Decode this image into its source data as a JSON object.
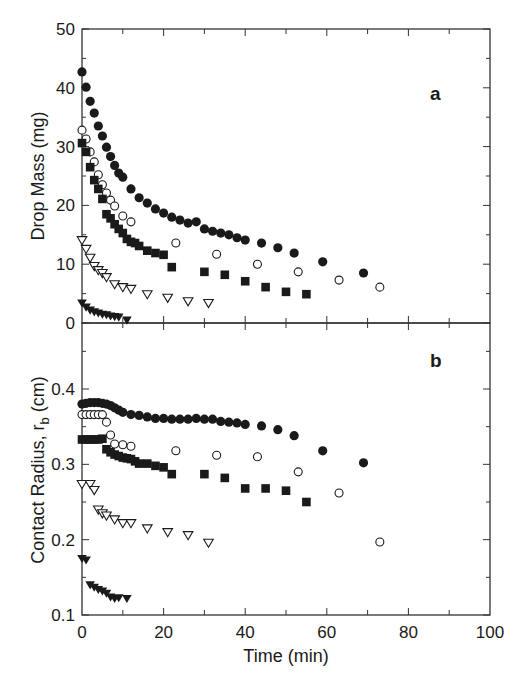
{
  "chart_data": [
    {
      "panel": "a",
      "type": "scatter",
      "title": "",
      "panel_label": "a",
      "xlabel": "Time (min)",
      "ylabel": "Drop Mass (mg)",
      "xlim": [
        0,
        100
      ],
      "ylim": [
        0,
        50
      ],
      "yticks": [
        0,
        10,
        20,
        30,
        40,
        50
      ],
      "grid": false,
      "series": [
        {
          "name": "filled circles",
          "marker": "filled-circle",
          "x": [
            0,
            1,
            2,
            3,
            4,
            5,
            6,
            7,
            8,
            9,
            10,
            12,
            14,
            16,
            18,
            20,
            22,
            24,
            26,
            28,
            30,
            32,
            34,
            36,
            38,
            40,
            44,
            48,
            52,
            59,
            69
          ],
          "y": [
            42.7,
            40.1,
            37.7,
            35.7,
            33.5,
            31.8,
            29.9,
            28.3,
            26.8,
            25.5,
            24.8,
            22.8,
            21.3,
            20.4,
            19.4,
            18.7,
            18.0,
            17.5,
            17.0,
            17.2,
            16.0,
            15.6,
            15.3,
            15.0,
            14.5,
            14.1,
            13.6,
            12.8,
            11.9,
            10.4,
            8.5
          ]
        },
        {
          "name": "open circles",
          "marker": "open-circle",
          "x": [
            0,
            1,
            2,
            3,
            4,
            5,
            6,
            7,
            8,
            10,
            12,
            23,
            33,
            43,
            53,
            63,
            73
          ],
          "y": [
            32.8,
            31.3,
            29.1,
            27.4,
            25.2,
            23.5,
            22.1,
            20.9,
            19.9,
            18.2,
            17.2,
            13.6,
            11.7,
            10.0,
            8.7,
            7.3,
            6.1
          ]
        },
        {
          "name": "filled squares",
          "marker": "filled-square",
          "x": [
            0,
            1,
            2,
            3,
            4,
            5,
            6,
            7,
            8,
            9,
            10,
            11,
            12,
            13,
            14,
            16,
            18,
            20,
            22,
            30,
            35,
            40,
            45,
            50,
            55
          ],
          "y": [
            30.6,
            29.1,
            26.5,
            24.3,
            22.8,
            21.1,
            18.5,
            17.8,
            16.8,
            16.0,
            15.3,
            14.3,
            13.8,
            13.6,
            13.1,
            12.3,
            11.9,
            11.6,
            9.5,
            8.7,
            8.2,
            7.1,
            6.1,
            5.3,
            4.9
          ]
        },
        {
          "name": "open triangles",
          "marker": "open-triangle-down",
          "x": [
            0,
            1,
            2,
            3,
            4,
            5,
            6,
            8,
            10,
            12,
            16,
            21,
            26,
            31
          ],
          "y": [
            14.1,
            12.6,
            11.1,
            9.7,
            9.0,
            8.5,
            7.8,
            6.6,
            6.1,
            5.8,
            4.9,
            4.3,
            3.7,
            3.4
          ]
        },
        {
          "name": "filled triangles",
          "marker": "filled-triangle-down",
          "x": [
            0,
            1,
            2,
            3,
            4,
            5,
            6,
            7,
            8,
            9,
            11
          ],
          "y": [
            3.4,
            2.7,
            2.2,
            1.9,
            1.7,
            1.5,
            1.4,
            1.2,
            1.1,
            1.0,
            0.5
          ]
        }
      ]
    },
    {
      "panel": "b",
      "type": "scatter",
      "title": "",
      "panel_label": "b",
      "xlabel": "Time (min)",
      "ylabel": "Contact Radius, r_b (cm)",
      "ylabel_main": "Contact Radius, r",
      "ylabel_sub": "b",
      "ylabel_unit": " (cm)",
      "xlim": [
        0,
        100
      ],
      "ylim": [
        0.1,
        0.487
      ],
      "yticks": [
        0.1,
        0.2,
        0.3,
        0.4
      ],
      "xticks": [
        0,
        20,
        40,
        60,
        80,
        100
      ],
      "grid": false,
      "series": [
        {
          "name": "filled circles",
          "marker": "filled-circle",
          "x": [
            0,
            1,
            2,
            3,
            4,
            5,
            6,
            7,
            8,
            9,
            10,
            12,
            14,
            16,
            18,
            20,
            22,
            24,
            26,
            28,
            30,
            32,
            34,
            36,
            38,
            40,
            44,
            48,
            52,
            59,
            69
          ],
          "y": [
            0.38,
            0.381,
            0.382,
            0.382,
            0.382,
            0.381,
            0.38,
            0.378,
            0.375,
            0.372,
            0.369,
            0.366,
            0.365,
            0.363,
            0.361,
            0.361,
            0.36,
            0.36,
            0.36,
            0.361,
            0.36,
            0.36,
            0.357,
            0.356,
            0.355,
            0.353,
            0.351,
            0.346,
            0.338,
            0.318,
            0.302
          ]
        },
        {
          "name": "open circles",
          "marker": "open-circle",
          "x": [
            0,
            1,
            2,
            3,
            4,
            5,
            6,
            7,
            8,
            10,
            12,
            23,
            33,
            43,
            53,
            63,
            73
          ],
          "y": [
            0.366,
            0.366,
            0.366,
            0.366,
            0.366,
            0.366,
            0.356,
            0.339,
            0.327,
            0.326,
            0.324,
            0.318,
            0.312,
            0.31,
            0.29,
            0.262,
            0.197
          ]
        },
        {
          "name": "filled squares",
          "marker": "filled-square",
          "x": [
            0,
            1,
            2,
            3,
            4,
            5,
            6,
            7,
            8,
            9,
            10,
            11,
            12,
            13,
            14,
            16,
            18,
            20,
            22,
            30,
            35,
            40,
            45,
            50,
            55
          ],
          "y": [
            0.333,
            0.333,
            0.333,
            0.333,
            0.333,
            0.334,
            0.32,
            0.316,
            0.313,
            0.311,
            0.309,
            0.308,
            0.307,
            0.304,
            0.301,
            0.301,
            0.298,
            0.296,
            0.287,
            0.287,
            0.282,
            0.268,
            0.268,
            0.265,
            0.25
          ]
        },
        {
          "name": "open triangles",
          "marker": "open-triangle-down",
          "x": [
            0,
            2,
            3,
            4,
            5,
            6,
            8,
            10,
            12,
            16,
            21,
            26,
            31
          ],
          "y": [
            0.274,
            0.274,
            0.266,
            0.24,
            0.235,
            0.232,
            0.227,
            0.222,
            0.222,
            0.215,
            0.21,
            0.206,
            0.196
          ]
        },
        {
          "name": "filled triangles",
          "marker": "filled-triangle-down",
          "x": [
            0,
            1,
            2,
            3,
            4,
            5,
            6,
            7,
            8,
            9,
            11
          ],
          "y": [
            0.175,
            0.173,
            0.14,
            0.137,
            0.134,
            0.132,
            0.129,
            0.124,
            0.122,
            0.123,
            0.122
          ]
        }
      ]
    }
  ],
  "labels": {
    "panel_a": "a",
    "panel_b": "b",
    "ylabel_a": "Drop Mass (mg)",
    "ylabel_b_main": "Contact Radius, r",
    "ylabel_b_sub": "b",
    "ylabel_b_unit": " (cm)",
    "xlabel": "Time (min)"
  },
  "colors": {
    "ink": "#1a1a1a",
    "frame": "#333333",
    "background": "#ffffff"
  }
}
